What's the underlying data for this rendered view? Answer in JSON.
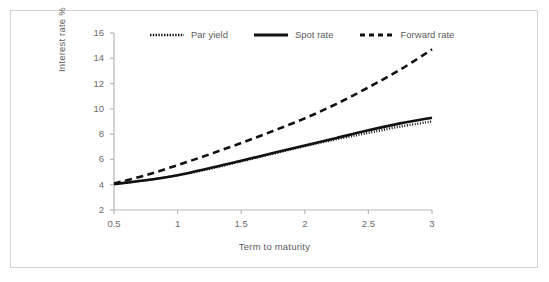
{
  "figure": {
    "border_color": "#d3d3d3",
    "background": "#ffffff",
    "ink_color": "#111111",
    "text_color": "#5c5c5c"
  },
  "legend": {
    "position": "top-center",
    "items": [
      {
        "label": "Par yield",
        "style": "dotted"
      },
      {
        "label": "Spot rate",
        "style": "solid"
      },
      {
        "label": "Forward rate",
        "style": "dashed"
      }
    ]
  },
  "chart_data": {
    "type": "line",
    "title": "",
    "xlabel": "Term to maturity",
    "ylabel": "Interest rate %",
    "xlim": [
      0.5,
      3
    ],
    "ylim": [
      2,
      16
    ],
    "xticks": [
      "0.5",
      "1",
      "1.5",
      "2",
      "2.5",
      "3"
    ],
    "yticks": [
      "2",
      "4",
      "6",
      "8",
      "10",
      "12",
      "14",
      "16"
    ],
    "grid": false,
    "legend_position": "top",
    "x": [
      0.5,
      0.75,
      1,
      1.25,
      1.5,
      1.75,
      2,
      2.25,
      2.5,
      2.75,
      3
    ],
    "series": [
      {
        "name": "Par yield",
        "style": "dotted",
        "values": [
          4.05,
          4.35,
          4.75,
          5.25,
          5.85,
          6.45,
          7.05,
          7.6,
          8.1,
          8.6,
          9.0
        ]
      },
      {
        "name": "Spot rate",
        "style": "solid",
        "values": [
          4.05,
          4.35,
          4.75,
          5.3,
          5.9,
          6.5,
          7.1,
          7.7,
          8.3,
          8.85,
          9.3
        ]
      },
      {
        "name": "Forward rate",
        "style": "dashed",
        "values": [
          4.1,
          4.75,
          5.55,
          6.4,
          7.3,
          8.25,
          9.25,
          10.4,
          11.7,
          13.1,
          14.7
        ]
      }
    ]
  }
}
